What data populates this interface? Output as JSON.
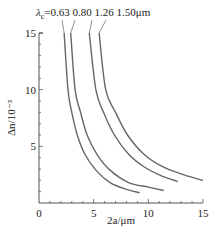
{
  "chart_data": {
    "type": "line",
    "title": "",
    "xlabel": "2a/μm",
    "ylabel": "Δn/10⁻³",
    "xlim": [
      0,
      15
    ],
    "ylim": [
      0,
      15
    ],
    "xticks": [
      "0",
      "5",
      "10",
      "15"
    ],
    "yticks": [
      "5",
      "10",
      "15"
    ],
    "grid": false,
    "legend_prefix": "λc=",
    "legend_labels": [
      "0.63",
      "0.80",
      "1.26",
      "1.50μm"
    ],
    "series": [
      {
        "name": "λc=0.63μm",
        "x": [
          2.3,
          2.65,
          3.0,
          3.5,
          4.2,
          5.2,
          6.5,
          8.0,
          9.2
        ],
        "y": [
          15,
          10,
          8,
          6,
          4.3,
          2.9,
          1.8,
          1.2,
          0.9
        ]
      },
      {
        "name": "λc=0.80μm",
        "x": [
          2.9,
          3.3,
          3.8,
          4.4,
          5.3,
          6.5,
          8.2,
          10.0,
          11.4
        ],
        "y": [
          15,
          10,
          8,
          6,
          4.3,
          2.9,
          1.8,
          1.4,
          1.1
        ]
      },
      {
        "name": "λc=1.26μm",
        "x": [
          4.6,
          5.2,
          5.9,
          6.9,
          8.2,
          9.6,
          11.2,
          12.7
        ],
        "y": [
          15,
          10,
          8,
          6,
          4.3,
          3.2,
          2.4,
          1.9
        ]
      },
      {
        "name": "λc=1.50μm",
        "x": [
          5.5,
          6.1,
          7.0,
          8.1,
          9.6,
          11.3,
          13.2,
          15.0
        ],
        "y": [
          15,
          10,
          8,
          6,
          4.3,
          3.2,
          2.5,
          2.0
        ]
      }
    ]
  }
}
